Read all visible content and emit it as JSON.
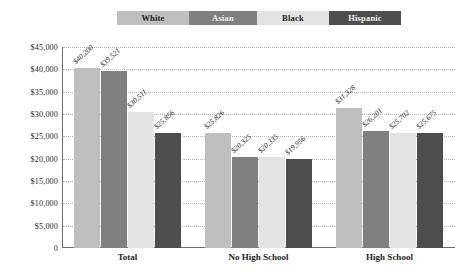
{
  "chart_data": {
    "type": "bar",
    "title": "",
    "xlabel": "",
    "ylabel": "",
    "ylim": [
      0,
      45000
    ],
    "yticks": [
      "0",
      "$5,000",
      "$10,000",
      "$15,000",
      "$20,000",
      "$25,000",
      "$30,000",
      "$35,000",
      "$40,000",
      "$45,000"
    ],
    "ytick_values": [
      0,
      5000,
      10000,
      15000,
      20000,
      25000,
      30000,
      35000,
      40000,
      45000
    ],
    "grid": true,
    "legend_position": "top",
    "categories": [
      "Total",
      "No High School",
      "High School"
    ],
    "series": [
      {
        "name": "White",
        "color": "#bfbfbf",
        "values": [
          40200,
          25826,
          31328
        ],
        "labels": [
          "$40,200",
          "$25,826",
          "$31,328"
        ]
      },
      {
        "name": "Asian",
        "color": "#808080",
        "values": [
          39521,
          20325,
          26201
        ],
        "labels": [
          "$39,521",
          "$20,325",
          "$26,201"
        ]
      },
      {
        "name": "Black",
        "color": "#e3e3e3",
        "values": [
          30511,
          20335,
          25702
        ],
        "labels": [
          "$30,511",
          "$20,335",
          "$25,702"
        ]
      },
      {
        "name": "Hispanic",
        "color": "#4d4d4d",
        "values": [
          25856,
          19956,
          25675
        ],
        "labels": [
          "$25,856",
          "$19,956",
          "$25,675"
        ]
      }
    ]
  },
  "legend": {
    "items": [
      {
        "label": "White"
      },
      {
        "label": "Asian"
      },
      {
        "label": "Black"
      },
      {
        "label": "Hispanic"
      }
    ]
  },
  "title_sliver": ""
}
